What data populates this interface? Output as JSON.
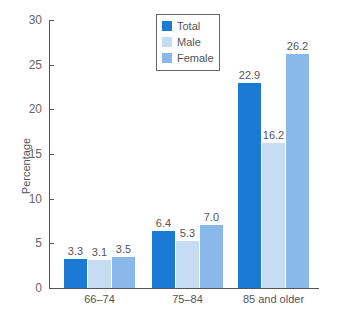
{
  "chart_data": {
    "type": "bar",
    "title": "",
    "xlabel": "",
    "ylabel": "Percentage",
    "ylim": [
      0,
      30
    ],
    "yticks": [
      0,
      5,
      10,
      15,
      20,
      25,
      30
    ],
    "categories": [
      "66–74",
      "75–84",
      "85 and older"
    ],
    "series": [
      {
        "name": "Total",
        "color": "#1b7ad4",
        "values": [
          3.3,
          6.4,
          22.9
        ],
        "labels": [
          "3.3",
          "6.4",
          "22.9"
        ]
      },
      {
        "name": "Male",
        "color": "#c5dcf3",
        "values": [
          3.1,
          5.3,
          16.2
        ],
        "labels": [
          "3.1",
          "5.3",
          "16.2"
        ]
      },
      {
        "name": "Female",
        "color": "#8ab8e8",
        "values": [
          3.5,
          7.0,
          26.2
        ],
        "labels": [
          "3.5",
          "7.0",
          "26.2"
        ]
      }
    ],
    "legend_position": "top-center",
    "grid": false
  }
}
